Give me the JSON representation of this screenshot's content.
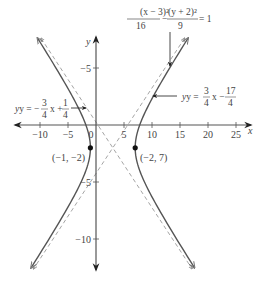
{
  "chart_data": {
    "type": "line",
    "title": "",
    "equation": {
      "numerator_left": "(x − 3)²",
      "denominator_left": "16",
      "minus": "−",
      "numerator_right": "(y + 2)²",
      "denominator_right": "9",
      "equals": "= 1"
    },
    "hyperbola": {
      "h": 3,
      "k": -2,
      "a": 4,
      "b": 3,
      "orientation": "horizontal"
    },
    "asymptotes": [
      {
        "label_lhs": "y = −",
        "num1": "3",
        "den1": "4",
        "mid": "x +",
        "num2": "1",
        "den2": "4",
        "slope": -0.75,
        "intercept": 0.25
      },
      {
        "label_lhs": "y =",
        "num1": "3",
        "den1": "4",
        "mid": "x −",
        "num2": "17",
        "den2": "4",
        "slope": 0.75,
        "intercept": -4.25
      }
    ],
    "points": [
      {
        "label": "(−1, −2)",
        "x": -1,
        "y": -2
      },
      {
        "label": "(−2, 7)",
        "x": 7,
        "y": -2
      }
    ],
    "xlabel": "x",
    "ylabel": "y",
    "x_ticks": [
      {
        "value": -10,
        "label": "−10"
      },
      {
        "value": -5,
        "label": "−5"
      },
      {
        "value": 0,
        "label": "0"
      },
      {
        "value": 5,
        "label": "5"
      },
      {
        "value": 10,
        "label": "10"
      },
      {
        "value": 15,
        "label": "15"
      },
      {
        "value": 20,
        "label": "20"
      },
      {
        "value": 25,
        "label": "25"
      }
    ],
    "y_ticks": [
      {
        "value": 5,
        "label": "−5"
      },
      {
        "value": -5,
        "label": "−5"
      },
      {
        "value": -10,
        "label": "−10"
      }
    ],
    "xlim": [
      -12.5,
      27.5
    ],
    "ylim": [
      -12.5,
      7.5
    ],
    "grid": false,
    "colors": {
      "curve": "#555555",
      "asymptote": "#999999",
      "axis": "#444444",
      "point": "#111111"
    }
  }
}
